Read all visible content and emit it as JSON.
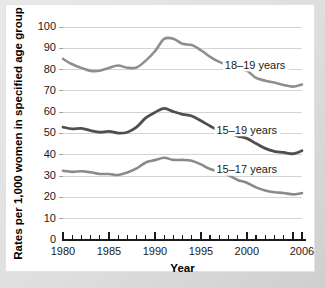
{
  "chart_data": {
    "type": "line",
    "title": "",
    "xlabel": "Year",
    "ylabel": "Rates per 1,000 women in specified age group",
    "xlim": [
      1980,
      2006
    ],
    "ylim": [
      0,
      100
    ],
    "grid": true,
    "legend_position": "inline-right",
    "x": [
      1980,
      1981,
      1982,
      1983,
      1984,
      1985,
      1986,
      1987,
      1988,
      1989,
      1990,
      1991,
      1992,
      1993,
      1994,
      1995,
      1996,
      1997,
      1998,
      1999,
      2000,
      2001,
      2002,
      2003,
      2004,
      2005,
      2006
    ],
    "xticks": [
      1980,
      1985,
      1990,
      1995,
      2000,
      2006
    ],
    "xtick_labels": [
      "1980",
      "1985",
      "1990",
      "1995",
      "2000",
      "2006"
    ],
    "yticks": [
      0,
      10,
      20,
      30,
      40,
      50,
      60,
      70,
      80,
      90,
      100
    ],
    "ytick_labels": [
      "0",
      "10",
      "20",
      "30",
      "40",
      "50",
      "60",
      "70",
      "80",
      "90",
      "100"
    ],
    "series": [
      {
        "name": "18–19 years",
        "color": "#8e8e8e",
        "values": [
          85.0,
          82.5,
          80.8,
          79.4,
          79.5,
          80.8,
          81.9,
          80.9,
          81.0,
          84.2,
          88.6,
          94.4,
          94.5,
          92.1,
          91.5,
          89.1,
          86.0,
          83.6,
          82.0,
          80.3,
          79.5,
          76.1,
          74.8,
          73.9,
          72.8,
          72.0,
          73.0
        ]
      },
      {
        "name": "15–19 years",
        "color": "#4f4f4f",
        "values": [
          53.0,
          52.2,
          52.4,
          51.4,
          50.6,
          51.0,
          50.2,
          50.6,
          53.0,
          57.3,
          59.9,
          61.8,
          60.3,
          59.0,
          58.2,
          56.0,
          53.5,
          51.3,
          50.3,
          48.8,
          47.7,
          45.3,
          43.0,
          41.6,
          41.1,
          40.5,
          41.9
        ]
      },
      {
        "name": "15–17 years",
        "color": "#8a8a8a",
        "values": [
          32.5,
          32.0,
          32.3,
          31.8,
          31.0,
          31.0,
          30.5,
          31.7,
          33.6,
          36.4,
          37.5,
          38.6,
          37.6,
          37.6,
          37.2,
          35.5,
          33.3,
          32.0,
          30.4,
          28.2,
          26.9,
          24.7,
          23.2,
          22.4,
          22.1,
          21.4,
          22.0
        ]
      }
    ],
    "annotations": [
      {
        "text": "18–19 years",
        "x": 1997.6,
        "y": 82.0
      },
      {
        "text": "15–19 years",
        "x": 1996.7,
        "y": 51.5
      },
      {
        "text": "15–17 years",
        "x": 1996.7,
        "y": 33.0
      }
    ]
  }
}
